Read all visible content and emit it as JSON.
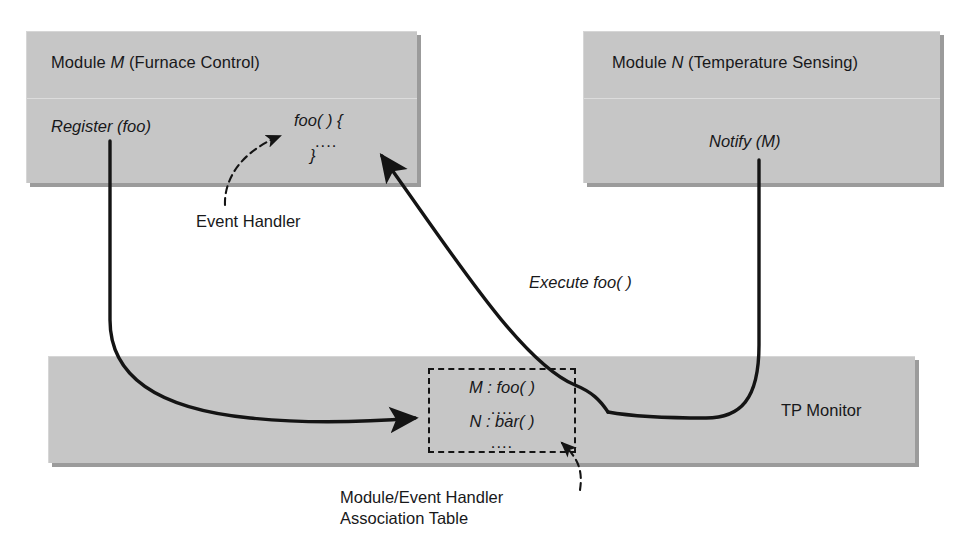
{
  "diagram": {
    "colors": {
      "box_fill": "#c6c6c6",
      "box_shadow": "#9b9b9b",
      "stroke": "#141414",
      "background": "#ffffff"
    }
  },
  "module_m": {
    "title_prefix": "Module ",
    "title_letter": "M",
    "title_suffix": " (Furnace Control)",
    "title_full": "Module M (Furnace Control)",
    "left_label": "Register (foo)",
    "handler_line_1": "foo( ) {",
    "handler_line_2": "....",
    "handler_line_3": "}"
  },
  "module_n": {
    "title_prefix": "Module ",
    "title_letter": "N",
    "title_suffix": " (Temperature Sensing)",
    "title_full": "Module N (Temperature Sensing)",
    "body_label": "Notify (M)"
  },
  "tp_monitor": {
    "label": "TP Monitor"
  },
  "association_table": {
    "rows": [
      {
        "text": "M :  foo( )"
      },
      {
        "text": "...."
      },
      {
        "text": "N :  bar( )"
      },
      {
        "text": "...."
      }
    ],
    "caption_line_1": "Module/Event Handler",
    "caption_line_2": "Association Table"
  },
  "annotations": {
    "event_handler": "Event Handler",
    "execute_foo": "Execute foo( )"
  }
}
